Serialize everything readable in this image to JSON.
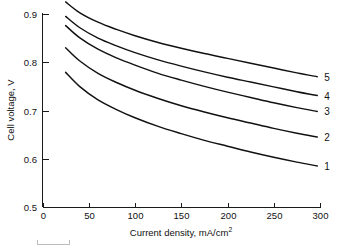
{
  "chart_data": {
    "type": "line",
    "title": "",
    "xlabel": "Current density, mA/cm",
    "xlabel_sup": "2",
    "ylabel": "Cell voltage, V",
    "xlim": [
      0,
      300
    ],
    "ylim": [
      0.5,
      0.925
    ],
    "grid": false,
    "legend_position": "right-inline-labels",
    "xticks": [
      0,
      50,
      100,
      150,
      200,
      250,
      300
    ],
    "xtick_labels": [
      "0",
      "50",
      "100",
      "150",
      "200",
      "250",
      "300"
    ],
    "yticks": [
      0.5,
      0.6,
      0.7,
      0.8,
      0.9
    ],
    "ytick_labels": [
      "0.5",
      "0.6",
      "0.7",
      "0.8",
      "0.9"
    ],
    "x": [
      25,
      40,
      60,
      80,
      100,
      125,
      150,
      175,
      200,
      225,
      250,
      275,
      297
    ],
    "series": [
      {
        "name": "5",
        "label": "5",
        "values": [
          0.925,
          0.903,
          0.883,
          0.868,
          0.855,
          0.841,
          0.829,
          0.818,
          0.808,
          0.798,
          0.788,
          0.778,
          0.77
        ]
      },
      {
        "name": "4",
        "label": "4",
        "values": [
          0.895,
          0.872,
          0.85,
          0.834,
          0.82,
          0.805,
          0.792,
          0.78,
          0.769,
          0.759,
          0.749,
          0.739,
          0.731
        ]
      },
      {
        "name": "3",
        "label": "3",
        "values": [
          0.876,
          0.851,
          0.827,
          0.809,
          0.794,
          0.777,
          0.763,
          0.75,
          0.738,
          0.727,
          0.716,
          0.706,
          0.698
        ]
      },
      {
        "name": "2",
        "label": "2",
        "values": [
          0.83,
          0.803,
          0.777,
          0.758,
          0.742,
          0.725,
          0.71,
          0.697,
          0.685,
          0.674,
          0.663,
          0.653,
          0.645
        ]
      },
      {
        "name": "1",
        "label": "1",
        "values": [
          0.779,
          0.75,
          0.722,
          0.702,
          0.685,
          0.667,
          0.652,
          0.638,
          0.626,
          0.614,
          0.603,
          0.593,
          0.585
        ]
      }
    ]
  },
  "colors": {
    "curve_stroke": "#111111",
    "axis_stroke": "#1a1a1a",
    "background": "#ffffff"
  }
}
